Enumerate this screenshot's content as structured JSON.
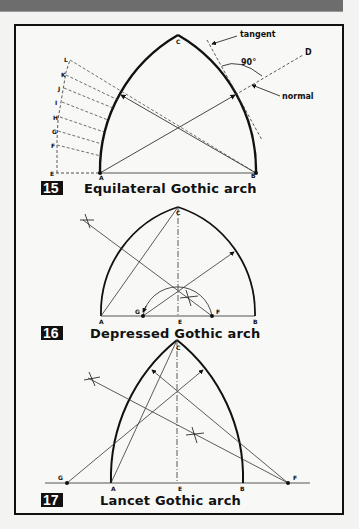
{
  "page": {
    "background": "#f3f3f1",
    "top_band_color": "#6d6d6d",
    "frame_border_color": "#111111"
  },
  "figures": [
    {
      "number": "15",
      "caption": "Equilateral Gothic arch",
      "points": {
        "A": "A",
        "B": "B",
        "C": "C",
        "D": "D"
      },
      "side_points": [
        "L",
        "K",
        "J",
        "I",
        "H",
        "G",
        "F",
        "E"
      ],
      "annotations": {
        "tangent": "tangent",
        "normal": "normal",
        "angle": "90°"
      }
    },
    {
      "number": "16",
      "caption": "Depressed Gothic arch",
      "points": {
        "A": "A",
        "B": "B",
        "C": "C",
        "E": "E",
        "F": "F",
        "G": "G"
      }
    },
    {
      "number": "17",
      "caption": "Lancet Gothic arch",
      "points": {
        "A": "A",
        "B": "B",
        "C": "C",
        "E": "E",
        "F": "F",
        "G": "G"
      }
    }
  ]
}
